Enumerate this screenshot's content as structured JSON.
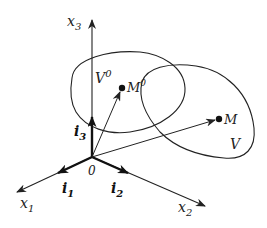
{
  "figure": {
    "type": "coordinate-system-diagram",
    "axes": [
      {
        "id": "x1",
        "label": "x",
        "subscript": "1"
      },
      {
        "id": "x2",
        "label": "x",
        "subscript": "2"
      },
      {
        "id": "x3",
        "label": "x",
        "subscript": "3"
      }
    ],
    "unit_vectors": [
      {
        "id": "i1",
        "label": "i",
        "subscript": "1"
      },
      {
        "id": "i2",
        "label": "i",
        "subscript": "2"
      },
      {
        "id": "i3",
        "label": "i",
        "subscript": "3"
      }
    ],
    "origin": {
      "label": "0"
    },
    "regions": [
      {
        "id": "V0",
        "label": "V",
        "superscript": "0"
      },
      {
        "id": "V",
        "label": "V"
      }
    ],
    "points": [
      {
        "id": "M0",
        "label": "M",
        "superscript": "0"
      },
      {
        "id": "M",
        "label": "M"
      }
    ],
    "colors": {
      "stroke": "#222222",
      "background": "#ffffff"
    }
  }
}
